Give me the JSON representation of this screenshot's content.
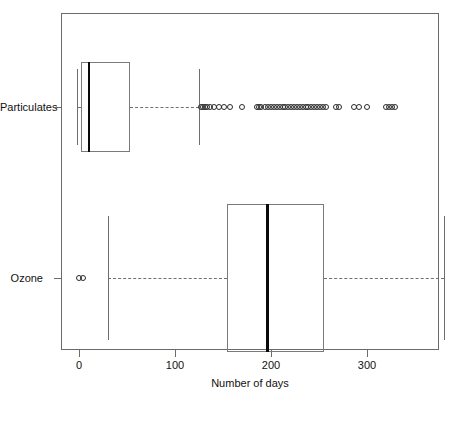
{
  "chart_data": {
    "type": "box",
    "title": "",
    "xlabel": "Number of days",
    "ylabel": "",
    "orientation": "horizontal",
    "xlim": [
      -10,
      375
    ],
    "xticks": [
      0,
      100,
      200,
      300
    ],
    "xticklabels": [
      "0",
      "100",
      "200",
      "300"
    ],
    "grid": false,
    "legend": "none",
    "categories": [
      "Particulates",
      "Ozone"
    ],
    "boxes": [
      {
        "name": "Particulates",
        "whisker_low": -2,
        "q1": 2,
        "median": 10,
        "q3": 53,
        "whisker_high": 125,
        "outliers": [
          127,
          129,
          131,
          133,
          136,
          141,
          146,
          151,
          157,
          170,
          185,
          187,
          190,
          194,
          197,
          200,
          203,
          206,
          209,
          212,
          215,
          218,
          221,
          224,
          227,
          230,
          233,
          236,
          239,
          242,
          245,
          248,
          251,
          254,
          257,
          268,
          271,
          286,
          292,
          300,
          320,
          323,
          326,
          329
        ]
      },
      {
        "name": "Ozone",
        "whisker_low": 30,
        "q1": 154,
        "median": 196,
        "q3": 255,
        "whisker_high": 380,
        "outliers": [
          0,
          4
        ]
      }
    ]
  },
  "axis": {
    "x_title": "Number of days",
    "tick_0": "0",
    "tick_100": "100",
    "tick_200": "200",
    "tick_300": "300",
    "cat_particulates": "Particulates",
    "cat_ozone": "Ozone"
  }
}
